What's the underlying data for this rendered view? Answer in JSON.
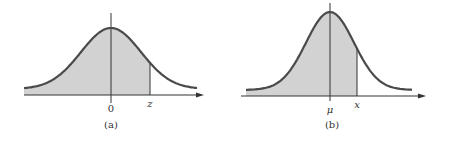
{
  "figure": {
    "colors": {
      "curve": "#4a4a4a",
      "fill": "#d2d2d2",
      "axis": "#333333",
      "text": "#333333"
    },
    "panels": [
      {
        "caption": "(a)",
        "center_label": "0",
        "marker_label": "z",
        "description": "Standard normal curve with area shaded to the left of z"
      },
      {
        "caption": "(b)",
        "center_label": "μ",
        "marker_label": "x",
        "description": "Normal curve with mean μ, area shaded to the left of x"
      }
    ]
  }
}
